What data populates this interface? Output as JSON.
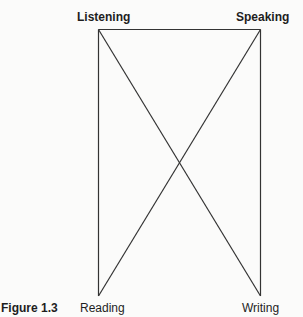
{
  "figure": {
    "caption": "Figure 1.3",
    "corners": {
      "top_left": "Listening",
      "top_right": "Speaking",
      "bottom_left": "Reading",
      "bottom_right": "Writing"
    },
    "line_color": "#333333",
    "background_color": "#fbfbfa"
  },
  "diagram": {
    "nodes": [
      {
        "id": "listening",
        "label": "Listening",
        "position": "top-left",
        "bold": true
      },
      {
        "id": "speaking",
        "label": "Speaking",
        "position": "top-right",
        "bold": true
      },
      {
        "id": "reading",
        "label": "Reading",
        "position": "bottom-left",
        "bold": false
      },
      {
        "id": "writing",
        "label": "Writing",
        "position": "bottom-right",
        "bold": false
      }
    ],
    "edges": [
      {
        "from": "listening",
        "to": "speaking"
      },
      {
        "from": "listening",
        "to": "reading"
      },
      {
        "from": "speaking",
        "to": "writing"
      },
      {
        "from": "listening",
        "to": "writing"
      },
      {
        "from": "speaking",
        "to": "reading"
      }
    ]
  }
}
